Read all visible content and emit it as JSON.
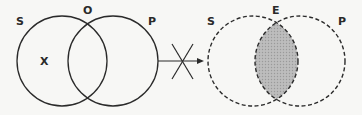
{
  "diagram": {
    "type": "venn-inference",
    "left": {
      "style": "solid",
      "labels": {
        "subject": "S",
        "predicate": "P",
        "top": "O",
        "mark": "X"
      }
    },
    "connector": {
      "type": "arrow",
      "crossed": true,
      "meaning": "does not imply"
    },
    "right": {
      "style": "dashed",
      "labels": {
        "subject": "S",
        "predicate": "P",
        "top": "E"
      },
      "shaded_region": "intersection",
      "shade_color": "#b8b8b8"
    },
    "line_color": "#2a2a2a"
  }
}
